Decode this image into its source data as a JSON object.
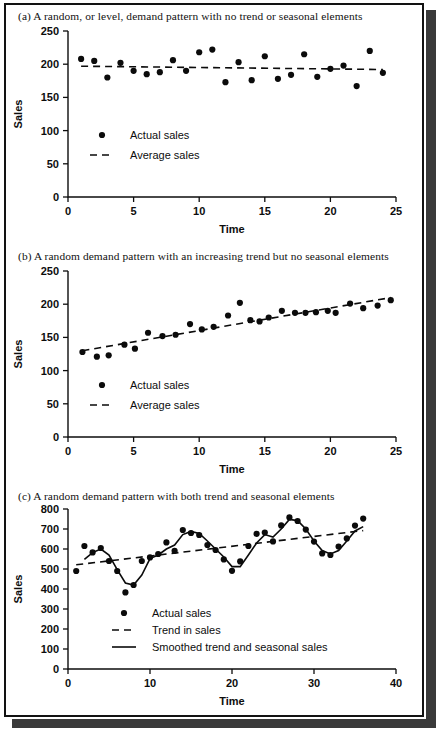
{
  "figure": {
    "panels": [
      {
        "id": "a",
        "caption": "(a) A random, or level, demand pattern with no trend or seasonal elements",
        "legend": [
          {
            "marker": "dot",
            "label": "Actual sales"
          },
          {
            "marker": "dashed",
            "label": "Average sales"
          }
        ]
      },
      {
        "id": "b",
        "caption": "(b) A random demand pattern with an increasing trend but no seasonal elements",
        "legend": [
          {
            "marker": "dot",
            "label": "Actual sales"
          },
          {
            "marker": "dashed",
            "label": "Average sales"
          }
        ]
      },
      {
        "id": "c",
        "caption": "(c) A random demand pattern with both trend and seasonal elements",
        "legend": [
          {
            "marker": "dot",
            "label": "Actual sales"
          },
          {
            "marker": "dashed",
            "label": "Trend in sales"
          },
          {
            "marker": "solid",
            "label": "Smoothed trend and seasonal sales"
          }
        ]
      }
    ]
  },
  "chart_data": [
    {
      "type": "scatter",
      "title": "(a) A random, or level, demand pattern with no trend or seasonal elements",
      "xlabel": "Time",
      "ylabel": "Sales",
      "xlim": [
        0,
        25
      ],
      "ylim": [
        0,
        250
      ],
      "xticks": [
        0,
        5,
        10,
        15,
        20,
        25
      ],
      "yticks": [
        0,
        50,
        100,
        150,
        200,
        250
      ],
      "grid": false,
      "legend_position": "inside-left",
      "series": [
        {
          "name": "Actual sales",
          "style": "dot",
          "x": [
            1,
            2,
            3,
            4,
            5,
            6,
            7,
            8,
            9,
            10,
            11,
            12,
            13,
            14,
            15,
            16,
            17,
            18,
            19,
            20,
            21,
            22,
            23,
            24
          ],
          "values": [
            208,
            205,
            180,
            202,
            190,
            185,
            188,
            206,
            190,
            218,
            222,
            173,
            203,
            176,
            212,
            178,
            184,
            215,
            181,
            193,
            198,
            167,
            220,
            187
          ]
        },
        {
          "name": "Average sales",
          "style": "dashed",
          "x": [
            1,
            24
          ],
          "values": [
            197,
            192
          ]
        }
      ]
    },
    {
      "type": "scatter",
      "title": "(b) A random demand pattern with an increasing trend but no seasonal elements",
      "xlabel": "Time",
      "ylabel": "Sales",
      "xlim": [
        0,
        25
      ],
      "ylim": [
        0,
        250
      ],
      "xticks": [
        0,
        5,
        10,
        15,
        20,
        25
      ],
      "yticks": [
        0,
        50,
        100,
        150,
        200,
        250
      ],
      "grid": false,
      "legend_position": "inside-left",
      "series": [
        {
          "name": "Actual sales",
          "style": "dot",
          "x": [
            1.1,
            2.2,
            3.1,
            4.3,
            5.1,
            6.1,
            7.2,
            8.2,
            9.3,
            10.2,
            11.1,
            12.2,
            13.1,
            13.9,
            14.6,
            15.3,
            16.3,
            17.3,
            18.1,
            18.9,
            19.8,
            20.4,
            21.5,
            22.5,
            23.6,
            24.6
          ],
          "values": [
            128,
            121,
            123,
            139,
            133,
            157,
            152,
            154,
            170,
            162,
            166,
            183,
            202,
            176,
            174,
            180,
            190,
            187,
            187,
            188,
            190,
            187,
            201,
            194,
            198,
            206
          ]
        },
        {
          "name": "Average sales",
          "style": "dashed",
          "x": [
            1.1,
            24.6
          ],
          "values": [
            130,
            210
          ]
        }
      ]
    },
    {
      "type": "scatter",
      "title": "(c) A random demand pattern with both trend and seasonal elements",
      "xlabel": "Time",
      "ylabel": "Sales",
      "xlim": [
        0,
        40
      ],
      "ylim": [
        0,
        800
      ],
      "xticks": [
        0,
        10,
        20,
        30,
        40
      ],
      "yticks": [
        0,
        100,
        200,
        300,
        400,
        500,
        600,
        700,
        800
      ],
      "grid": false,
      "legend_position": "inside-left",
      "series": [
        {
          "name": "Actual sales",
          "style": "dot",
          "x": [
            1,
            2,
            3,
            4,
            5,
            6,
            7,
            8,
            9,
            10,
            11,
            12,
            13,
            14,
            15,
            16,
            17,
            18,
            19,
            20,
            21,
            22,
            23,
            24,
            25,
            26,
            27,
            28,
            29,
            30,
            31,
            32,
            33,
            34,
            35,
            36
          ],
          "values": [
            490,
            615,
            583,
            605,
            540,
            490,
            383,
            420,
            540,
            558,
            575,
            633,
            591,
            695,
            680,
            670,
            620,
            595,
            548,
            491,
            538,
            615,
            676,
            682,
            638,
            718,
            758,
            740,
            697,
            637,
            578,
            570,
            612,
            653,
            717,
            752
          ]
        },
        {
          "name": "Trend in sales",
          "style": "dashed",
          "x": [
            1,
            36
          ],
          "values": [
            521,
            692
          ]
        },
        {
          "name": "Smoothed trend and seasonal sales",
          "style": "solid",
          "x": [
            2,
            3,
            4,
            5,
            6,
            7,
            8,
            9,
            10,
            11,
            12,
            13,
            14,
            15,
            16,
            17,
            18,
            19,
            20,
            21,
            22,
            23,
            24,
            25,
            26,
            27,
            28,
            29,
            30,
            31,
            32,
            33,
            34,
            35,
            36
          ],
          "values": [
            548,
            582,
            600,
            570,
            497,
            430,
            420,
            470,
            552,
            570,
            600,
            620,
            672,
            688,
            678,
            640,
            600,
            560,
            512,
            512,
            570,
            630,
            672,
            660,
            700,
            748,
            742,
            700,
            640,
            592,
            575,
            592,
            640,
            690,
            712
          ]
        }
      ]
    }
  ]
}
